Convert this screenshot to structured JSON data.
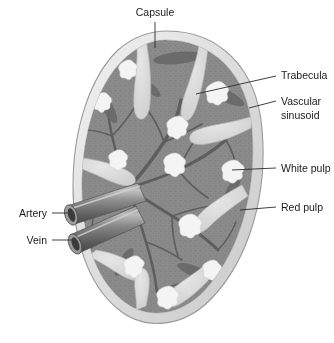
{
  "figure": {
    "background_color": "#ffffff"
  },
  "colors": {
    "background": "#ffffff",
    "capsule": "#dcdcdc",
    "capsule_outline": "#9a9a9a",
    "capsule_highlight": "#f0f0f0",
    "red_pulp": "#8b8b8b",
    "red_pulp_dark": "#6e6e6e",
    "trabecula": "#dadada",
    "trabecula_edge": "#b6b6b6",
    "white_pulp": "#f2f2f2",
    "vessel_dark": "#4d4d4d",
    "vessel_mid": "#7d7d7d",
    "vessel_light": "#a8a8a8",
    "vessel_lumen": "#3c3c3c",
    "leader_line": "#2b2b2b",
    "label_text": "#1a1a1a"
  },
  "labels": [
    {
      "id": "capsule",
      "text": "Capsule",
      "lines": [
        "Capsule"
      ],
      "position": "top",
      "text_x": 155,
      "text_y": 16,
      "anchor": "middle"
    },
    {
      "id": "trabecula",
      "text": "Trabecula",
      "lines": [
        "Trabecula"
      ],
      "position": "right",
      "text_x": 281,
      "text_y": 79,
      "anchor": "start"
    },
    {
      "id": "vascular-sinusoid",
      "text": "Vascular sinusoid",
      "lines": [
        "Vascular",
        "sinusoid"
      ],
      "position": "right",
      "text_x": 281,
      "text_y": 105,
      "anchor": "start"
    },
    {
      "id": "white-pulp",
      "text": "White pulp",
      "lines": [
        "White pulp"
      ],
      "position": "right",
      "text_x": 281,
      "text_y": 172,
      "anchor": "start"
    },
    {
      "id": "red-pulp",
      "text": "Red pulp",
      "lines": [
        "Red pulp"
      ],
      "position": "right",
      "text_x": 281,
      "text_y": 211,
      "anchor": "start"
    },
    {
      "id": "artery",
      "text": "Artery",
      "lines": [
        "Artery"
      ],
      "position": "left",
      "text_x": 47,
      "text_y": 216,
      "anchor": "end"
    },
    {
      "id": "vein",
      "text": "Vein",
      "lines": [
        "Vein"
      ],
      "position": "left",
      "text_x": 47,
      "text_y": 243,
      "anchor": "end"
    }
  ],
  "structures": {
    "capsule_name": "capsule",
    "red_pulp_name": "red pulp",
    "white_pulp_name": "white pulp",
    "trabecula_name": "trabecula",
    "artery_name": "splenic artery",
    "vein_name": "splenic vein"
  },
  "counts": {
    "white_pulp_nodules": 11,
    "trabeculae": 8,
    "vessels": 2
  }
}
